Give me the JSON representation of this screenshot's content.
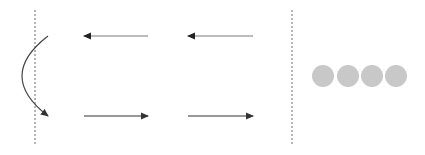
{
  "diagram": {
    "colors": {
      "background": "#ffffff",
      "dashed_line": "#6a6a6a",
      "arrow_left": "#7a7a7a",
      "arrow_right": "#333333",
      "curve": "#444444",
      "circle_fill": "#c8c8c8"
    },
    "dividers": [
      {
        "name": "left-divider",
        "x": 35,
        "y1": 10,
        "y2": 146
      },
      {
        "name": "right-divider",
        "x": 292,
        "y1": 10,
        "y2": 146
      }
    ],
    "arrows": [
      {
        "name": "arrow-left-1",
        "direction": "left",
        "x1": 148,
        "x2": 84,
        "y": 36
      },
      {
        "name": "arrow-left-2",
        "direction": "left",
        "x1": 253,
        "x2": 188,
        "y": 36
      },
      {
        "name": "arrow-right-1",
        "direction": "right",
        "x1": 84,
        "x2": 148,
        "y": 116
      },
      {
        "name": "arrow-right-2",
        "direction": "right",
        "x1": 188,
        "x2": 253,
        "y": 116
      }
    ],
    "curved_arrow": {
      "name": "reflection-curve",
      "from": [
        48,
        36
      ],
      "control": [
        -4,
        76
      ],
      "to": [
        48,
        116
      ]
    },
    "circles": [
      {
        "name": "circle-1",
        "cx": 323,
        "cy": 76,
        "r": 11
      },
      {
        "name": "circle-2",
        "cx": 348,
        "cy": 76,
        "r": 11
      },
      {
        "name": "circle-3",
        "cx": 372,
        "cy": 76,
        "r": 11
      },
      {
        "name": "circle-4",
        "cx": 396,
        "cy": 76,
        "r": 11
      }
    ]
  }
}
